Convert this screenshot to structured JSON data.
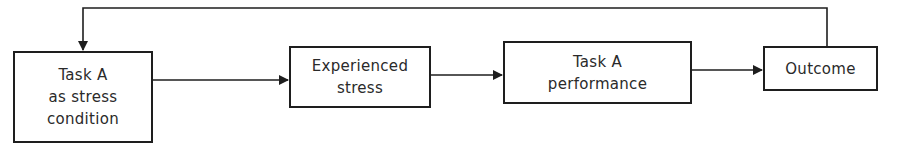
{
  "diagram": {
    "title": "",
    "colors": {
      "stroke": "#1e1e1e",
      "text": "#2a2a2a",
      "background": "#ffffff"
    },
    "nodes": [
      {
        "id": "task-a-stress",
        "lines": [
          "Task A",
          "as stress",
          "condition"
        ]
      },
      {
        "id": "experienced-stress",
        "lines": [
          "Experienced",
          "stress"
        ]
      },
      {
        "id": "task-a-performance",
        "lines": [
          "Task A",
          "performance"
        ]
      },
      {
        "id": "outcome",
        "lines": [
          "Outcome"
        ]
      }
    ],
    "edges": [
      {
        "from": "task-a-stress",
        "to": "experienced-stress"
      },
      {
        "from": "experienced-stress",
        "to": "task-a-performance"
      },
      {
        "from": "task-a-performance",
        "to": "outcome"
      },
      {
        "from": "outcome",
        "to": "task-a-stress",
        "type": "feedback"
      }
    ]
  }
}
